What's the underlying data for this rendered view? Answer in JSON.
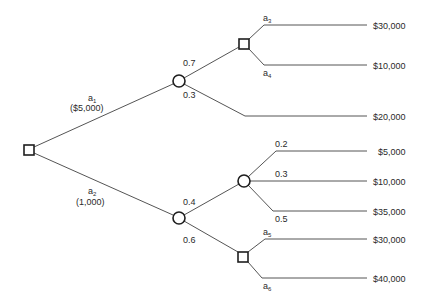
{
  "diagram": {
    "type": "decision-tree",
    "nodes": {
      "root": {
        "kind": "decision",
        "shape": "square"
      },
      "chance_a1": {
        "kind": "chance",
        "shape": "circle"
      },
      "decision_upper": {
        "kind": "decision",
        "shape": "square"
      },
      "chance_a2": {
        "kind": "chance",
        "shape": "circle"
      },
      "chance_lower": {
        "kind": "chance",
        "shape": "circle"
      },
      "decision_lower": {
        "kind": "decision",
        "shape": "square"
      }
    },
    "branches": {
      "a1": {
        "letter": "a",
        "sub": "1",
        "cost": "($5,000)"
      },
      "a2": {
        "letter": "a",
        "sub": "2",
        "cost": "(1,000)"
      },
      "p_upper_07": "0.7",
      "p_upper_03": "0.3",
      "a3": {
        "letter": "a",
        "sub": "3"
      },
      "a4": {
        "letter": "a",
        "sub": "4"
      },
      "p_lower_04": "0.4",
      "p_lower_06": "0.6",
      "p_02": "0.2",
      "p_03": "0.3",
      "p_05": "0.5",
      "a5": {
        "letter": "a",
        "sub": "5"
      },
      "a6": {
        "letter": "a",
        "sub": "6"
      }
    },
    "payoffs": {
      "a3": "$30,000",
      "a4": "$10,000",
      "upper_03": "$20,000",
      "p_02": "$5,000",
      "p_03": "$10,000",
      "p_05": "$35,000",
      "a5": "$30,000",
      "a6": "$40,000"
    }
  }
}
